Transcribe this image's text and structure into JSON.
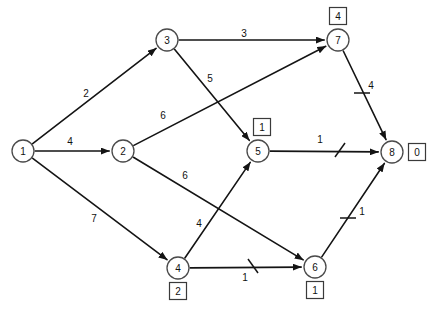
{
  "diagram": {
    "type": "directed-network-graph",
    "title": "",
    "canvas": {
      "width": 434,
      "height": 309,
      "background": "#ffffff"
    },
    "stroke_color": "#141414",
    "node_stroke_color": "#4a4a4a",
    "nodes": [
      {
        "id": "1",
        "label": "1",
        "x": 23,
        "y": 151,
        "r": 11,
        "box": null
      },
      {
        "id": "2",
        "label": "2",
        "x": 123,
        "y": 151,
        "r": 11,
        "box": null
      },
      {
        "id": "3",
        "label": "3",
        "x": 167,
        "y": 40,
        "r": 11,
        "box": null
      },
      {
        "id": "4",
        "label": "4",
        "x": 178,
        "y": 268,
        "r": 11,
        "box": {
          "value": "2",
          "x": 178,
          "y": 291
        }
      },
      {
        "id": "5",
        "label": "5",
        "x": 258,
        "y": 151,
        "r": 11,
        "box": {
          "value": "1",
          "x": 262,
          "y": 127
        }
      },
      {
        "id": "6",
        "label": "6",
        "x": 315,
        "y": 267,
        "r": 11,
        "box": {
          "value": "1",
          "x": 315,
          "y": 290
        }
      },
      {
        "id": "7",
        "label": "7",
        "x": 338,
        "y": 40,
        "r": 11,
        "box": {
          "value": "4",
          "x": 338,
          "y": 16
        }
      },
      {
        "id": "8",
        "label": "8",
        "x": 392,
        "y": 152,
        "r": 11,
        "box": {
          "value": "0",
          "x": 417,
          "y": 152
        }
      }
    ],
    "edges": [
      {
        "from": "1",
        "to": "3",
        "weight": "2",
        "label_x": 86,
        "label_y": 93,
        "tick": null
      },
      {
        "from": "1",
        "to": "2",
        "weight": "4",
        "label_x": 70,
        "label_y": 141,
        "tick": null
      },
      {
        "from": "1",
        "to": "4",
        "weight": "7",
        "label_x": 94,
        "label_y": 218,
        "tick": null
      },
      {
        "from": "3",
        "to": "7",
        "weight": "3",
        "label_x": 244,
        "label_y": 33,
        "tick": null
      },
      {
        "from": "3",
        "to": "5",
        "weight": "5",
        "label_x": 210,
        "label_y": 78,
        "tick": null
      },
      {
        "from": "2",
        "to": "7",
        "weight": "6",
        "label_x": 163,
        "label_y": 115,
        "tick": null
      },
      {
        "from": "2",
        "to": "6",
        "weight": "6",
        "label_x": 185,
        "label_y": 175,
        "tick": null
      },
      {
        "from": "4",
        "to": "5",
        "weight": "4",
        "label_x": 199,
        "label_y": 223,
        "tick": null
      },
      {
        "from": "4",
        "to": "6",
        "weight": "1",
        "label_x": 245,
        "label_y": 277,
        "tick": {
          "type": "backslash",
          "x": 253,
          "y": 266
        }
      },
      {
        "from": "5",
        "to": "8",
        "weight": "1",
        "label_x": 320,
        "label_y": 139,
        "tick": {
          "type": "slash",
          "x": 340,
          "y": 150
        }
      },
      {
        "from": "7",
        "to": "8",
        "weight": "4",
        "label_x": 371,
        "label_y": 85,
        "tick": {
          "type": "cross-bar",
          "x": 362,
          "y": 93
        }
      },
      {
        "from": "6",
        "to": "8",
        "weight": "1",
        "label_x": 362,
        "label_y": 211,
        "tick": {
          "type": "cross-bar",
          "x": 348,
          "y": 218
        }
      }
    ]
  }
}
